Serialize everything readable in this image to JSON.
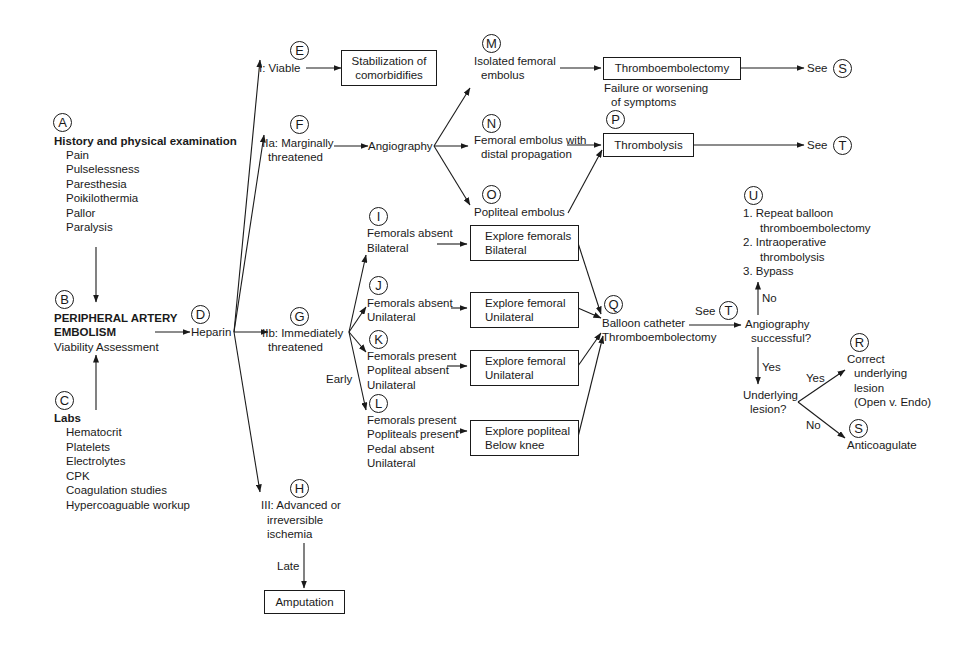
{
  "diagram": {
    "type": "flowchart",
    "topic": "Peripheral artery embolism management algorithm",
    "nodes": {
      "A": {
        "marker": "A",
        "title": "History and physical examination",
        "items": [
          "Pain",
          "Pulselessness",
          "Paresthesia",
          "Poikilothermia",
          "Pallor",
          "Paralysis"
        ]
      },
      "B": {
        "marker": "B",
        "title_line1": "PERIPHERAL ARTERY",
        "title_line2": "EMBOLISM",
        "subtitle": "Viability Assessment"
      },
      "C": {
        "marker": "C",
        "title": "Labs",
        "items": [
          "Hematocrit",
          "Platelets",
          "Electrolytes",
          "CPK",
          "Coagulation studies",
          "Hypercoaguable workup"
        ]
      },
      "D": {
        "marker": "D",
        "label": "Heparin"
      },
      "E": {
        "marker": "E",
        "label": "I: Viable",
        "box": [
          "Stabilization of",
          "comorbidifies"
        ]
      },
      "F": {
        "marker": "F",
        "label": [
          "IIa: Marginally",
          "threatened"
        ],
        "next": "Angiography"
      },
      "G": {
        "marker": "G",
        "label": [
          "IIb: Immediately",
          "threatened"
        ],
        "branch_label": "Early"
      },
      "H": {
        "marker": "H",
        "label": [
          "III:  Advanced or",
          "irreversible",
          "ischemia"
        ],
        "edge_label": "Late",
        "box": "Amputation"
      },
      "I": {
        "marker": "I",
        "label": [
          "Femorals absent",
          "Bilateral"
        ],
        "box": [
          "Explore femorals",
          "Bilateral"
        ]
      },
      "J": {
        "marker": "J",
        "label": [
          "Femorals absent",
          "Unilateral"
        ],
        "box": [
          "Explore femoral",
          "Unilateral"
        ]
      },
      "K": {
        "marker": "K",
        "label": [
          "Femorals present",
          "Popliteal absent",
          "Unilateral"
        ],
        "box": [
          "Explore femoral",
          "Unilateral"
        ]
      },
      "L": {
        "marker": "L",
        "label": [
          "Femorals present",
          "Popliteals present",
          "Pedal absent",
          "Unilateral"
        ],
        "box": [
          "Explore popliteal",
          "Below knee"
        ]
      },
      "M": {
        "marker": "M",
        "label": [
          "Isolated femoral",
          "embolus"
        ],
        "box": "Thromboembolectomy",
        "see": "See",
        "see_marker": "S"
      },
      "N": {
        "marker": "N",
        "label": [
          "Femoral embolus with",
          "distal propagation"
        ]
      },
      "O": {
        "marker": "O",
        "label": "Popliteal embolus"
      },
      "P": {
        "marker": "P",
        "note": [
          "Failure or worsening",
          "of symptoms"
        ],
        "box": "Thrombolysis",
        "see": "See",
        "see_marker": "T"
      },
      "Q": {
        "marker": "Q",
        "label": [
          "Balloon catheter",
          "Thromboembolectomy"
        ],
        "see": "See",
        "see_marker": "T"
      },
      "decision1": {
        "label": [
          "Angiography",
          "successful?"
        ],
        "no": "No",
        "yes": "Yes"
      },
      "U": {
        "marker": "U",
        "items": [
          [
            "1. Repeat balloon",
            "thromboembolectomy"
          ],
          [
            "2. Intraoperative",
            "thrombolysis"
          ],
          [
            "3. Bypass"
          ]
        ]
      },
      "decision2": {
        "label": [
          "Underlying",
          "lesion?"
        ],
        "yes": "Yes",
        "no": "No"
      },
      "R": {
        "marker": "R",
        "label": [
          "Correct",
          "underlying",
          "lesion",
          "(Open v. Endo)"
        ]
      },
      "S": {
        "marker": "S",
        "label": "Anticoagulate"
      }
    }
  }
}
